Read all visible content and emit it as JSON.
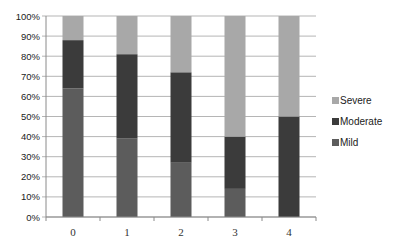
{
  "chart_data": {
    "type": "bar",
    "stacked": true,
    "normalized_percent": true,
    "title": "",
    "xlabel": "",
    "ylabel": "",
    "categories": [
      "0",
      "1",
      "2",
      "3",
      "4"
    ],
    "series": [
      {
        "name": "Mild",
        "color": "#5c5c5c",
        "values": [
          64,
          39,
          27,
          14,
          0
        ]
      },
      {
        "name": "Moderate",
        "color": "#3b3b3b",
        "values": [
          24,
          42,
          45,
          26,
          50
        ]
      },
      {
        "name": "Severe",
        "color": "#a8a8a8",
        "values": [
          12,
          19,
          28,
          60,
          50
        ]
      }
    ],
    "ylim": [
      0,
      100
    ],
    "yticks": [
      "0%",
      "10%",
      "20%",
      "30%",
      "40%",
      "50%",
      "60%",
      "70%",
      "80%",
      "90%",
      "100%"
    ],
    "grid": true,
    "legend": {
      "position": "right",
      "entries": [
        "Severe",
        "Moderate",
        "Mild"
      ]
    }
  }
}
